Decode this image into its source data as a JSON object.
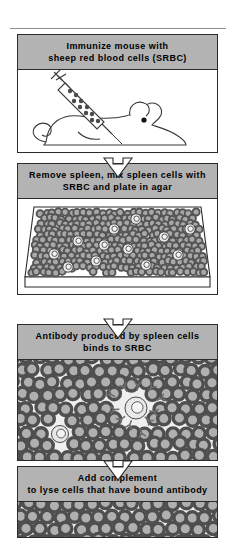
{
  "figure": {
    "title_steps": 4,
    "colors": {
      "header_bar": "#b3b3b3",
      "panel_border": "#2b2b2b",
      "cell_ring": "#555555",
      "cell_fill": "#a8a8a8",
      "spleen_cell_fill": "#e8e8e8",
      "background": "#ffffff"
    }
  },
  "steps": [
    {
      "id": "step-immunize",
      "header_line1": "Immunize mouse with",
      "header_line2": "sheep red blood cells (SRBC)",
      "art": "mouse-with-syringe",
      "art_elements": [
        "syringe",
        "srbc-in-barrel",
        "mouse",
        "mouse-eye",
        "mouse-tail"
      ]
    },
    {
      "id": "step-plate",
      "header_line1": "Remove spleen, mix spleen cells with",
      "header_line2": "SRBC and plate in agar",
      "art": "agar-dish-with-cells",
      "art_elements": [
        "petri-dish",
        "srbc-lawn",
        "spleen-cells"
      ]
    },
    {
      "id": "step-antibody",
      "header_line1": "Antibody produced by spleen cells",
      "header_line2": "binds to SRBC",
      "art": "cell-field-with-antibody",
      "art_elements": [
        "srbc-field",
        "spleen-cell",
        "antibody-y-glyphs"
      ]
    },
    {
      "id": "step-complement",
      "header_line1": "Add complement",
      "header_line2": "to lyse cells that have bound antibody",
      "art": "cell-field",
      "art_elements": [
        "srbc-field"
      ]
    }
  ],
  "connectors": [
    {
      "id": "arrow-1",
      "icon": "down-arrow-icon"
    },
    {
      "id": "arrow-2",
      "icon": "down-arrow-icon"
    },
    {
      "id": "arrow-3",
      "icon": "down-arrow-icon"
    }
  ]
}
